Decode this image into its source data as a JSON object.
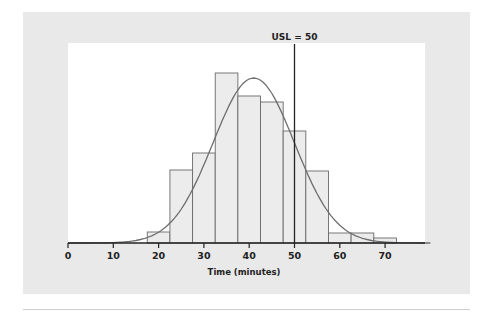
{
  "chart_data": {
    "type": "bar",
    "subtype": "histogram_with_normal_curve",
    "title": "",
    "xlabel": "Time (minutes)",
    "ylabel": "",
    "xlim": [
      0,
      80
    ],
    "x_ticks": [
      0,
      10,
      20,
      30,
      40,
      50,
      60,
      70
    ],
    "grid": false,
    "legend": null,
    "bin_width": 5,
    "categories": [
      "17.5-22.5",
      "22.5-27.5",
      "27.5-32.5",
      "32.5-37.5",
      "37.5-42.5",
      "42.5-47.5",
      "47.5-52.5",
      "52.5-57.5",
      "57.5-62.5",
      "62.5-67.5",
      "67.5-72.5"
    ],
    "bins": [
      {
        "start": 17.5,
        "end": 22.5,
        "height": 11
      },
      {
        "start": 22.5,
        "end": 27.5,
        "height": 73
      },
      {
        "start": 27.5,
        "end": 32.5,
        "height": 90
      },
      {
        "start": 32.5,
        "end": 37.5,
        "height": 170
      },
      {
        "start": 37.5,
        "end": 42.5,
        "height": 147
      },
      {
        "start": 42.5,
        "end": 47.5,
        "height": 141
      },
      {
        "start": 47.5,
        "end": 52.5,
        "height": 112
      },
      {
        "start": 52.5,
        "end": 57.5,
        "height": 72
      },
      {
        "start": 57.5,
        "end": 62.5,
        "height": 10
      },
      {
        "start": 62.5,
        "end": 67.5,
        "height": 10
      },
      {
        "start": 67.5,
        "end": 72.5,
        "height": 5
      }
    ],
    "values": [
      11,
      73,
      90,
      170,
      147,
      141,
      112,
      72,
      10,
      10,
      5
    ],
    "values_note": "relative bar heights (no y-axis shown); peak bin 32.5-37.5",
    "normal_curve": {
      "mean": 41,
      "sd": 9,
      "peak_height": 165
    },
    "reference_line": {
      "label": "USL = 50",
      "x": 50
    },
    "annotations": [
      "USL = 50"
    ]
  },
  "layout": {
    "x0_px": 68,
    "px_per_unit": 4.53,
    "baseline_px": 243,
    "plot_left": 68,
    "plot_top": 43,
    "plot_right": 425,
    "usl_top": 44
  },
  "colors": {
    "panel": "#e9e9e9",
    "plot_bg": "#ffffff",
    "bar_fill": "#ececec",
    "bar_stroke": "#6a6a6a",
    "curve": "#6e6e6e",
    "axis": "#222222",
    "usl_line": "#222222"
  }
}
